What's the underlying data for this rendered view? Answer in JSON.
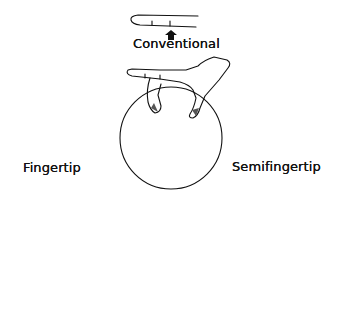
{
  "diagram": {
    "grips": [
      {
        "id": "conventional",
        "label": "Conventional"
      },
      {
        "id": "fingertip",
        "label": "Fingertip"
      },
      {
        "id": "semifingertip",
        "label": "Semifingertip"
      }
    ],
    "colors": {
      "line": "#111111",
      "background": "#ffffff",
      "fill_dark": "#555555"
    }
  }
}
